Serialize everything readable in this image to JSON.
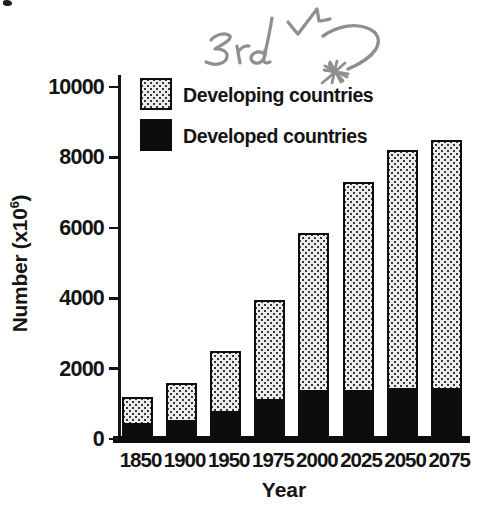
{
  "chart_data": {
    "type": "bar",
    "stacked": true,
    "title": "",
    "categories": [
      "1850",
      "1900",
      "1950",
      "1975",
      "2000",
      "2025",
      "2050",
      "2075"
    ],
    "series": [
      {
        "name": "Developed countries",
        "style": "solid-black",
        "color": "#0d0d0d",
        "values": [
          450,
          550,
          800,
          1150,
          1400,
          1400,
          1450,
          1450
        ]
      },
      {
        "name": "Developing countries",
        "style": "halftone-dot-pattern",
        "color": "#b8b8b8",
        "values": [
          750,
          1050,
          1700,
          2800,
          4450,
          5900,
          6750,
          7050
        ]
      }
    ],
    "totals": [
      1200,
      1600,
      2500,
      3950,
      5850,
      7300,
      8200,
      8500
    ],
    "xlabel": "Year",
    "ylabel": "Number (x10^6)",
    "ylabel_parts": {
      "prefix": "Number (x10",
      "superscript": "6",
      "suffix": ")"
    },
    "ylim": [
      0,
      10000
    ],
    "yticks": [
      0,
      2000,
      4000,
      6000,
      8000,
      10000
    ],
    "grid": false,
    "legend_position": "upper-left-inside"
  },
  "legend": {
    "items": [
      {
        "label": "Developing countries",
        "swatch": "halftone-dot-pattern"
      },
      {
        "label": "Developed countries",
        "swatch": "solid-black"
      }
    ]
  },
  "annotation": {
    "handwritten_text": "3rd W",
    "ink_color": "#8f8f8f"
  }
}
